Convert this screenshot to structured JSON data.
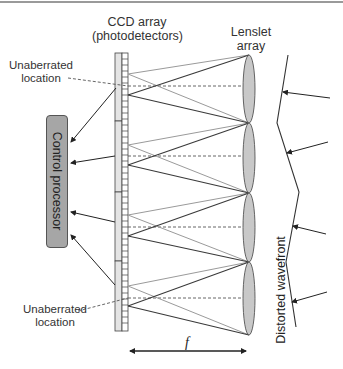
{
  "diagram": {
    "title_ccd_line1": "CCD array",
    "title_ccd_line2": "(photodetectors)",
    "title_lens_line1": "Lenslet",
    "title_lens_line2": "array",
    "unaberrated_top_line1": "Unaberrated",
    "unaberrated_top_line2": "location",
    "unaberrated_bottom_line1": "Unaberrated",
    "unaberrated_bottom_line2": "location",
    "control_processor": "Control processor",
    "distorted_wavefront": "Distorted wavefront",
    "focal_length_label": "f",
    "colors": {
      "lens_fill": "#c8c8c8",
      "processor_fill": "#a6a6a6",
      "ray_dark": "#3a3a3a",
      "ray_light": "#9a9a9a",
      "line": "#333333"
    },
    "lenslets": [
      {
        "top": 55,
        "bottom": 123,
        "ref_focus_y": 74,
        "actual_focus_y": 95
      },
      {
        "top": 123,
        "bottom": 193,
        "ref_focus_y": 145,
        "actual_focus_y": 165
      },
      {
        "top": 193,
        "bottom": 262,
        "ref_focus_y": 215,
        "actual_focus_y": 236
      },
      {
        "top": 262,
        "bottom": 335,
        "ref_focus_y": 286,
        "actual_focus_y": 306
      }
    ]
  }
}
